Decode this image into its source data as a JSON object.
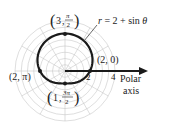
{
  "chart_data": {
    "type": "polar-curve",
    "title": "",
    "equation": "r = 2 + sin θ",
    "equation_parts": {
      "lhs": "r",
      "rhs": " = 2 + sin ",
      "theta": "θ"
    },
    "polar_axis_label": [
      "Polar",
      "axis"
    ],
    "axis_ticks": [
      {
        "value": 2,
        "label": "2"
      },
      {
        "value": 4,
        "label": "4"
      }
    ],
    "grid": {
      "r_max": 4,
      "ring_step": 0.5,
      "radial_step_deg": 30,
      "on": true
    },
    "curve": {
      "a": 2,
      "b": 1,
      "function": "sin"
    },
    "points": [
      {
        "r": 3,
        "theta": "π/2",
        "label_r": "3",
        "label_theta_num": "π",
        "label_theta_den": "2"
      },
      {
        "r": 2,
        "theta": "0",
        "label": "(2, 0)"
      },
      {
        "r": 2,
        "theta": "π",
        "label": "(2, π)"
      },
      {
        "r": 1,
        "theta": "3π/2",
        "label_r": "1",
        "label_theta_num": "3π",
        "label_theta_den": "2"
      }
    ]
  },
  "colors": {
    "grid": "#c8c8c8",
    "curve": "#1a1a1a",
    "axis": "#1a1a1a",
    "text": "#222222"
  }
}
